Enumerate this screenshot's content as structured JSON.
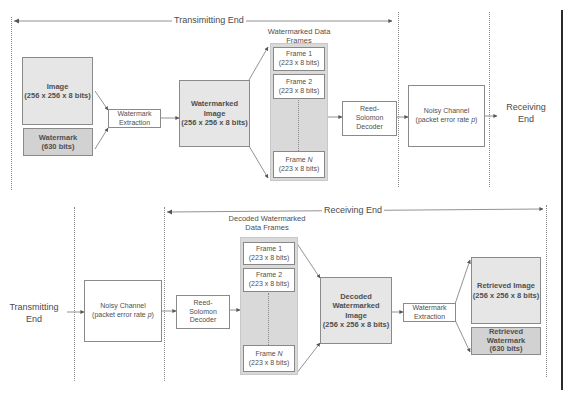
{
  "diagram": {
    "top": {
      "span_title": "Transimitting End",
      "image_box": {
        "title": "Image",
        "size": "(256 x 256 x 8 bits)"
      },
      "watermark_box": {
        "title": "Watermark",
        "size": "(630 bits)"
      },
      "extraction_box": {
        "line1": "Watermark",
        "line2": "Extraction"
      },
      "watermarked_image_box": {
        "line1": "Watermarked",
        "line2": "Image",
        "size": "(256 x 256 x 8 bits)"
      },
      "frames_label": {
        "line1": "Watermarked Data",
        "line2": "Frames"
      },
      "frames": [
        {
          "title": "Frame 1",
          "size": "(223 x 8 bits)"
        },
        {
          "title": "Frame 2",
          "size": "(223 x 8 bits)"
        },
        {
          "title": "Frame ",
          "var": "N",
          "size": "(223 x 8 bits)"
        }
      ],
      "rs_decoder": {
        "line1": "Reed-",
        "line2": "Solomon",
        "line3": "Decoder"
      },
      "noisy_channel": {
        "line1": "Noisy Channel",
        "line2": "(packet error rate ",
        "var": "p",
        "line2_end": ")"
      },
      "end_label": {
        "line1": "Receiving",
        "line2": "End"
      }
    },
    "bottom": {
      "span_title": "Receiving End",
      "start_label": {
        "line1": "Transmitting",
        "line2": "End"
      },
      "noisy_channel": {
        "line1": "Noisy Channel",
        "line2": "(packet error rate ",
        "var": "p",
        "line2_end": ")"
      },
      "rs_decoder": {
        "line1": "Reed-",
        "line2": "Solomon",
        "line3": "Decoder"
      },
      "frames_label": {
        "line1": "Decoded Watermarked",
        "line2": "Data Frames"
      },
      "frames": [
        {
          "title": "Frame 1",
          "size": "(223 x 8 bits)"
        },
        {
          "title": "Frame 2",
          "size": "(223 x 8 bits)"
        },
        {
          "title": "Frame ",
          "var": "N",
          "size": "(223 x 8 bits)"
        }
      ],
      "decoded_image_box": {
        "line1": "Decoded",
        "line2": "Watermarked",
        "line3": "Image",
        "size": "(256 x 256 x 8 bits)"
      },
      "extraction_box": {
        "line1": "Watermark",
        "line2": "Extraction"
      },
      "retrieved_image_box": {
        "title": "Retrieved Image",
        "size": "(256 x 256 x 8 bits)"
      },
      "retrieved_watermark_box": {
        "line1": "Retrieved",
        "line2": "Watermark",
        "size": "(630 bits)"
      }
    },
    "colors": {
      "light_fill": "#e6e6e6",
      "mid_fill": "#d2d2d2",
      "frames_fill": "#d9d9d9",
      "line": "#6a6a6a",
      "text": "#4a4a4a"
    }
  }
}
